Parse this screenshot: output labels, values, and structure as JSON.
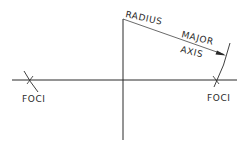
{
  "diagram": {
    "title": "",
    "colors": {
      "background": "#ffffff",
      "stroke": "#2a2a2a"
    },
    "labels": {
      "radius": "RADIUS",
      "major": "MAJOR",
      "axis": "AXIS",
      "foci_left": "FOCI",
      "foci_right": "FOCI"
    },
    "elements": {
      "horizontal_axis": {
        "x1": 12,
        "y1": 80,
        "x2": 237,
        "y2": 80
      },
      "vertical_axis": {
        "x1": 123,
        "y1": 19,
        "x2": 123,
        "y2": 140
      },
      "radius_line": {
        "x1": 123,
        "y1": 19,
        "x2": 226,
        "y2": 55
      },
      "left_focus": {
        "x": 30,
        "y": 80
      },
      "right_focus": {
        "x": 216,
        "y": 80
      }
    }
  }
}
